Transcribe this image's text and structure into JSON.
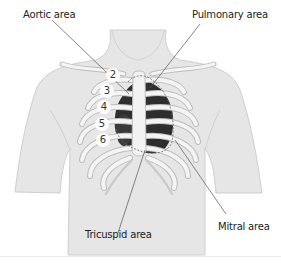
{
  "diagram": {
    "labels": {
      "aortic": "Aortic area",
      "pulmonary": "Pulmonary area",
      "tricuspid": "Tricuspid area",
      "mitral": "Mitral area"
    },
    "intercostal_numbers": [
      "2",
      "3",
      "4",
      "5",
      "6"
    ],
    "colors": {
      "skin": "#e6e6e6",
      "skin_edge": "#cfcfcf",
      "rib": "#f4f4f4",
      "rib_edge": "#bdbdbd",
      "heart_dark": "#2e2e2e",
      "leader_line": "#555555",
      "background": "#ffffff"
    }
  }
}
